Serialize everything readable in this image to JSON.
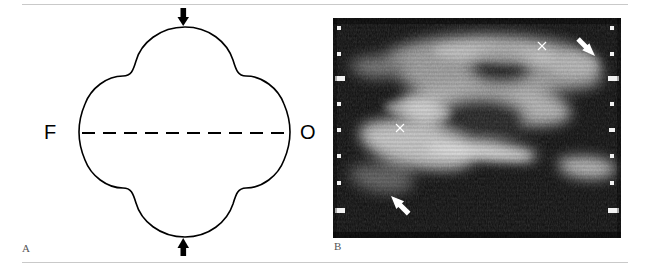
{
  "figure": {
    "width": 650,
    "height": 274,
    "background_color": "#ffffff",
    "rule_color": "#c9c9c9",
    "panels": [
      {
        "letter": "A",
        "type": "line-drawing"
      },
      {
        "letter": "B",
        "type": "ultrasound-image"
      }
    ]
  },
  "panel_a": {
    "letter": "A",
    "description": "Line drawing of a cloverleaf (trilobar) skull shape in axial section",
    "outline_color": "#000000",
    "fill_color": "#ffffff",
    "labels": [
      {
        "name": "frontal",
        "text": "F",
        "side": "left"
      },
      {
        "name": "occipital",
        "text": "O",
        "side": "right"
      }
    ],
    "midline": {
      "name": "interhemispheric-midline",
      "style": "dashed",
      "dash_count": 10,
      "color": "#000000"
    },
    "arrows": [
      {
        "name": "superior-arrow",
        "direction": "down",
        "color": "#000000"
      },
      {
        "name": "inferior-arrow",
        "direction": "up",
        "color": "#000000"
      }
    ]
  },
  "panel_b": {
    "letter": "B",
    "description": "Axial cranial ultrasound image showing cloverleaf skull contour",
    "background_color": "#0d0d0d",
    "scale_markers": {
      "name": "depth-scale-ticks",
      "color": "#f2f2f2",
      "left_tick_count": 8,
      "right_tick_count": 8
    },
    "arrows": [
      {
        "name": "upper-right-arrow",
        "direction": "down-left",
        "color": "#ffffff"
      },
      {
        "name": "lower-left-arrow",
        "direction": "up-right",
        "color": "#ffffff"
      }
    ],
    "calipers": [
      {
        "name": "caliper-marker-upper",
        "glyph": "x",
        "color": "#ffffff"
      },
      {
        "name": "caliper-marker-lower",
        "glyph": "x",
        "color": "#ffffff"
      }
    ]
  }
}
